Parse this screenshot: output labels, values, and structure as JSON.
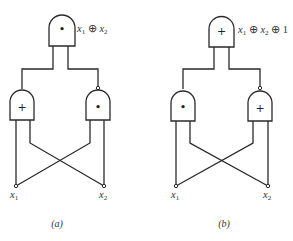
{
  "diagrams": [
    {
      "caption": "(a)",
      "output_label": {
        "var1": "x",
        "sub1": "1",
        "op1": " ⊕ ",
        "var2": "x",
        "sub2": "2",
        "tail": ""
      },
      "gates": {
        "top": {
          "symbol": "•",
          "type": "AND"
        },
        "left": {
          "symbol": "+",
          "type": "OR"
        },
        "right": {
          "symbol": "•",
          "type": "AND",
          "inverted_output": true
        }
      },
      "inputs": [
        {
          "var": "x",
          "sub": "1"
        },
        {
          "var": "x",
          "sub": "2"
        }
      ]
    },
    {
      "caption": "(b)",
      "output_label": {
        "var1": "x",
        "sub1": "1",
        "op1": " ⊕ ",
        "var2": "x",
        "sub2": "2",
        "tail": " ⊕ 1"
      },
      "gates": {
        "top": {
          "symbol": "+",
          "type": "OR"
        },
        "left": {
          "symbol": "•",
          "type": "AND"
        },
        "right": {
          "symbol": "+",
          "type": "OR",
          "inverted_output": true
        }
      },
      "inputs": [
        {
          "var": "x",
          "sub": "1"
        },
        {
          "var": "x",
          "sub": "2"
        }
      ]
    }
  ]
}
